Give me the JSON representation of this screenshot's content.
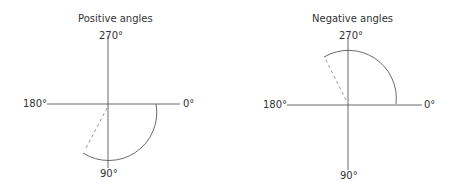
{
  "diagrams": [
    {
      "title": "Positive angles",
      "labels": {
        "top": "270°",
        "bottom": "90°",
        "left": "180°",
        "right": "0°"
      }
    },
    {
      "title": "Negative angles",
      "labels": {
        "top": "270°",
        "bottom": "90°",
        "left": "180°",
        "right": "0°"
      }
    }
  ],
  "colors": {
    "line": "#333333",
    "dash": "#888888"
  }
}
